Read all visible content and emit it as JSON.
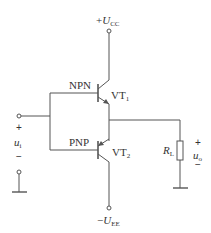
{
  "diagram": {
    "type": "complementary-push-pull-emitter-follower",
    "supply_positive": {
      "prefix": "+",
      "symbol": "U",
      "subscript": "CC"
    },
    "supply_negative": {
      "prefix": "−",
      "symbol": "U",
      "subscript": "EE"
    },
    "transistors": [
      {
        "id": "VT1",
        "symbol": "VT",
        "subscript": "1",
        "type_label": "NPN"
      },
      {
        "id": "VT2",
        "symbol": "VT",
        "subscript": "2",
        "type_label": "PNP"
      }
    ],
    "load": {
      "symbol": "R",
      "subscript": "L"
    },
    "input": {
      "symbol": "u",
      "subscript": "i",
      "plus": "+",
      "minus": "−"
    },
    "output": {
      "symbol": "u",
      "subscript": "o",
      "plus": "+",
      "minus": "−"
    },
    "colors": {
      "line": "#555555",
      "text": "#333333",
      "background": "#ffffff"
    }
  }
}
